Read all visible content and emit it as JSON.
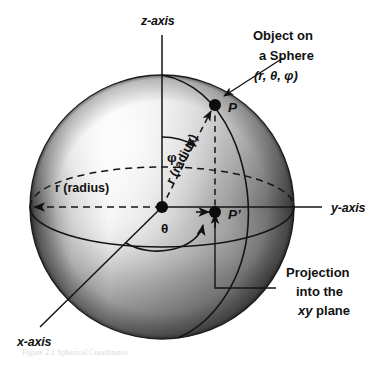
{
  "figure": {
    "type": "diagram"
  },
  "axes": {
    "z_label": "z-axis",
    "y_label": "y-axis",
    "x_label": "x-axis"
  },
  "callouts": {
    "object": {
      "line1": "Object on",
      "line2": "a Sphere",
      "line3": "(r, θ, φ)"
    },
    "projection": {
      "line1": "Projection",
      "line2": "into the",
      "line3_italic": "xy",
      "line3_rest": " plane"
    }
  },
  "points": {
    "p": "P",
    "p_prime": "P’"
  },
  "angles": {
    "phi": "φ",
    "theta": "θ"
  },
  "radii": {
    "equator_label": "r (radius)",
    "slant_label": "r (radius)"
  },
  "colors": {
    "ink": "#111111",
    "sphere_dark": "#3a3a3a",
    "sphere_mid": "#9a9a9a",
    "sphere_light": "#f2f2f2",
    "background": "#ffffff"
  },
  "geometry": {
    "sphere_center_x": 162,
    "sphere_center_y": 207,
    "sphere_radius": 132,
    "point_p_x": 215,
    "point_p_y": 105,
    "point_p_prime_x": 215,
    "point_p_prime_y": 212
  },
  "caption_ghost": "Figure 2.1  Spherical Coordinates"
}
